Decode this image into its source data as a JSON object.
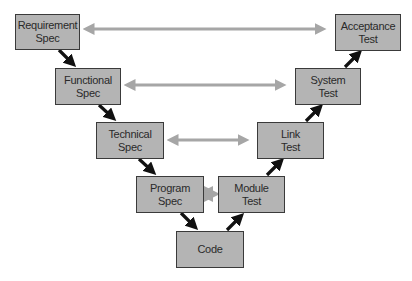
{
  "diagram": {
    "type": "V-model",
    "nodes": [
      {
        "id": "req",
        "label": "Requirement\nSpec",
        "line1": "Requirement",
        "line2": "Spec"
      },
      {
        "id": "func",
        "label": "Functional\nSpec",
        "line1": "Functional",
        "line2": "Spec"
      },
      {
        "id": "tech",
        "label": "Technical\nSpec",
        "line1": "Technical",
        "line2": "Spec"
      },
      {
        "id": "prog",
        "label": "Program\nSpec",
        "line1": "Program",
        "line2": "Spec"
      },
      {
        "id": "code",
        "label": "Code",
        "line1": "Code",
        "line2": ""
      },
      {
        "id": "mod",
        "label": "Module\nTest",
        "line1": "Module",
        "line2": "Test"
      },
      {
        "id": "link",
        "label": "Link\nTest",
        "line1": "Link",
        "line2": "Test"
      },
      {
        "id": "sys",
        "label": "System\nTest",
        "line1": "System",
        "line2": "Test"
      },
      {
        "id": "acc",
        "label": "Acceptance\nTest",
        "line1": "Acceptance",
        "line2": "Test"
      }
    ],
    "flow_edges": [
      [
        "req",
        "func"
      ],
      [
        "func",
        "tech"
      ],
      [
        "tech",
        "prog"
      ],
      [
        "prog",
        "code"
      ],
      [
        "code",
        "mod"
      ],
      [
        "mod",
        "link"
      ],
      [
        "link",
        "sys"
      ],
      [
        "sys",
        "acc"
      ]
    ],
    "correspondence_edges": [
      [
        "req",
        "acc"
      ],
      [
        "func",
        "sys"
      ],
      [
        "tech",
        "link"
      ],
      [
        "prog",
        "mod"
      ]
    ],
    "colors": {
      "box_fill": "#b4b4b4",
      "box_border": "#3a3a3a",
      "flow_arrow": "#111111",
      "correspondence_arrow": "#a6a6a6"
    }
  }
}
